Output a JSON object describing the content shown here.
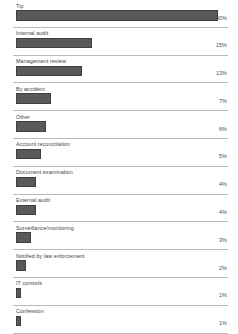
{
  "chart": {
    "axis_max_percent": 42,
    "bar_color": "#59595c",
    "rule_color": "#b9b9bd",
    "background_color": "#ffffff"
  },
  "chart_data": {
    "type": "bar",
    "orientation": "horizontal",
    "title": "",
    "subtitle": "",
    "xlabel": "",
    "ylabel": "",
    "grid": false,
    "legend": "none",
    "xlim": [
      0,
      42
    ],
    "categories": [
      "Tip",
      "Internal audit",
      "Management review",
      "By accident",
      "Other",
      "Account reconciliation",
      "Document examination",
      "External audit",
      "Surveillance/monitoring",
      "Notified by law enforcement",
      "IT controls",
      "Confession"
    ],
    "values": [
      40,
      15,
      13,
      7,
      6,
      5,
      4,
      4,
      3,
      2,
      1,
      1
    ],
    "value_labels": [
      "40%",
      "15%",
      "13%",
      "7%",
      "6%",
      "5%",
      "4%",
      "4%",
      "3%",
      "2%",
      "1%",
      "1%"
    ],
    "rows": [
      {
        "label": "Tip",
        "value": 40,
        "value_label": "40%"
      },
      {
        "label": "Internal audit",
        "value": 15,
        "value_label": "15%"
      },
      {
        "label": "Management review",
        "value": 13,
        "value_label": "13%"
      },
      {
        "label": "By accident",
        "value": 7,
        "value_label": "7%"
      },
      {
        "label": "Other",
        "value": 6,
        "value_label": "6%"
      },
      {
        "label": "Account reconciliation",
        "value": 5,
        "value_label": "5%"
      },
      {
        "label": "Document examination",
        "value": 4,
        "value_label": "4%"
      },
      {
        "label": "External audit",
        "value": 4,
        "value_label": "4%"
      },
      {
        "label": "Surveillance/monitoring",
        "value": 3,
        "value_label": "3%"
      },
      {
        "label": "Notified by law enforcement",
        "value": 2,
        "value_label": "2%"
      },
      {
        "label": "IT controls",
        "value": 1,
        "value_label": "1%"
      },
      {
        "label": "Confession",
        "value": 1,
        "value_label": "1%"
      }
    ]
  }
}
